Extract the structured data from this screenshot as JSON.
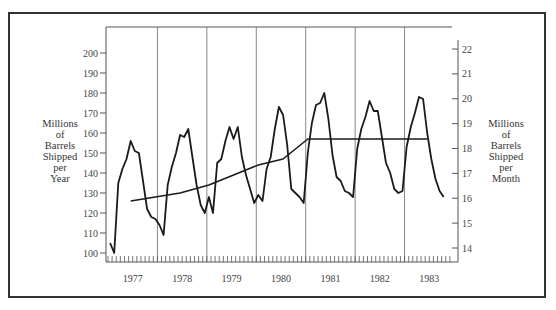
{
  "chart_data": {
    "type": "line",
    "title": "",
    "xlabel": "",
    "ylabel": "Millions of Barrels Shipped per Year",
    "y2label": "Millions of Barrels Shipped per Month",
    "ylim": [
      100,
      200
    ],
    "y2lim": [
      14,
      22
    ],
    "yticks": [
      100,
      110,
      120,
      130,
      140,
      150,
      160,
      170,
      180,
      190,
      200
    ],
    "y2ticks": [
      14,
      15,
      16,
      17,
      18,
      19,
      20,
      21,
      22
    ],
    "x_year_labels": [
      "1977",
      "1978",
      "1979",
      "1980",
      "1981",
      "1982",
      "1983"
    ],
    "x_unit": "month",
    "grid": "vertical lines at year boundaries",
    "legend": "none",
    "series": [
      {
        "name": "Monthly shipments (annualized)",
        "start": "1977-01",
        "values": [
          105,
          100,
          135,
          142,
          147,
          156,
          151,
          150,
          136,
          122,
          118,
          117,
          114,
          109,
          134,
          143,
          150,
          159,
          158,
          162,
          148,
          134,
          124,
          120,
          128,
          120,
          145,
          147,
          156,
          163,
          157,
          163,
          148,
          139,
          132,
          125,
          129,
          126,
          142,
          148,
          162,
          173,
          169,
          154,
          132,
          130,
          128,
          125,
          150,
          165,
          174,
          175,
          180,
          167,
          149,
          138,
          136,
          131,
          130,
          128,
          152,
          162,
          168,
          176,
          171,
          171,
          158,
          145,
          140,
          132,
          130,
          131,
          153,
          163,
          170,
          178,
          177,
          160,
          147,
          137,
          131,
          128
        ]
      },
      {
        "name": "Trend (12-month moving average)",
        "points": [
          {
            "month_index": 5,
            "value": 126
          },
          {
            "month_index": 17,
            "value": 130
          },
          {
            "month_index": 24,
            "value": 134
          },
          {
            "month_index": 30,
            "value": 139
          },
          {
            "month_index": 36,
            "value": 144
          },
          {
            "month_index": 42,
            "value": 147
          },
          {
            "month_index": 48,
            "value": 157
          },
          {
            "month_index": 77,
            "value": 157
          }
        ]
      }
    ]
  },
  "labels": {
    "left_title_lines": [
      "Millions",
      "of",
      "Barrels",
      "Shipped",
      "per",
      "Year"
    ],
    "right_title_lines": [
      "Millions",
      "of",
      "Barrels",
      "Shipped",
      "per",
      "Month"
    ]
  },
  "colors": {
    "line": "#1a1a1a",
    "grid": "#888888",
    "axis": "#555555",
    "frame": "#333333"
  }
}
